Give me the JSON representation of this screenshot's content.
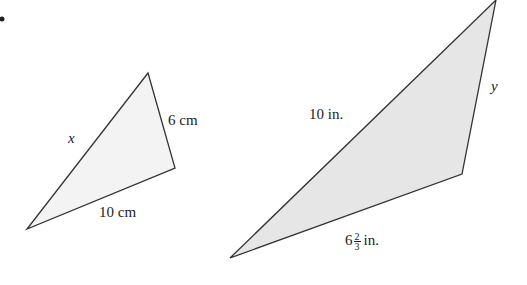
{
  "figure": {
    "bullet": "•",
    "triangles": [
      {
        "id": "small",
        "vertices": [
          [
            148,
            73
          ],
          [
            175,
            168
          ],
          [
            27,
            229
          ]
        ],
        "fill": "#f3f3f3",
        "stroke": "#333333",
        "labels": {
          "left_side": "x",
          "right_side": "6 cm",
          "bottom_side": "10 cm"
        }
      },
      {
        "id": "large",
        "vertices": [
          [
            496,
            0
          ],
          [
            462,
            174
          ],
          [
            230,
            258
          ]
        ],
        "fill": "#e6e6e6",
        "stroke": "#333333",
        "labels": {
          "left_side": "10 in.",
          "right_side": "y",
          "bottom_side_whole": "6",
          "bottom_side_num": "2",
          "bottom_side_den": "3",
          "bottom_side_unit": "in."
        }
      }
    ]
  }
}
